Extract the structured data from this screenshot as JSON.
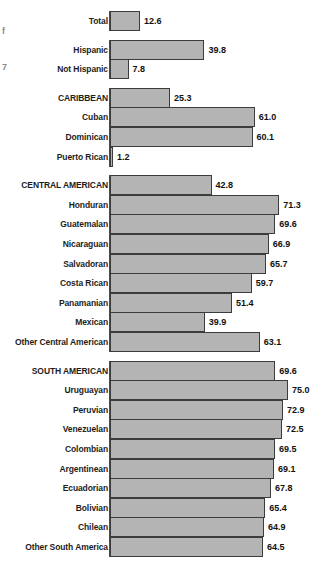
{
  "edge_artifacts": [
    {
      "text": "f",
      "top": 26
    },
    {
      "text": "7",
      "top": 62
    }
  ],
  "chart_data": {
    "type": "bar",
    "orientation": "horizontal",
    "title": "",
    "xlabel": "",
    "ylabel": "",
    "xlim": [
      0,
      75
    ],
    "grid": false,
    "legend": null,
    "axis_baseline": 0,
    "categories": [
      "Total",
      "Hispanic",
      "Not Hispanic",
      "CARIBBEAN",
      "Cuban",
      "Dominican",
      "Puerto Rican",
      "CENTRAL AMERICAN",
      "Honduran",
      "Guatemalan",
      "Nicaraguan",
      "Salvadoran",
      "Costa Rican",
      "Panamanian",
      "Mexican",
      "Other Central American",
      "SOUTH AMERICAN",
      "Uruguayan",
      "Peruvian",
      "Venezuelan",
      "Colombian",
      "Argentinean",
      "Ecuadorian",
      "Bolivian",
      "Chilean",
      "Other South America",
      "ALL OTHER HISPANIC"
    ],
    "values": [
      12.6,
      39.8,
      7.8,
      25.3,
      61.0,
      60.1,
      1.2,
      42.8,
      71.3,
      69.6,
      66.9,
      65.7,
      59.7,
      51.4,
      39.9,
      63.1,
      69.6,
      75.0,
      72.9,
      72.5,
      69.5,
      69.1,
      67.8,
      65.4,
      64.9,
      64.5,
      17.6
    ],
    "value_labels": [
      "12.6",
      "39.8",
      "7.8",
      "25.3",
      "61.0",
      "60.1",
      "1.2",
      "42.8",
      "71.3",
      "69.6",
      "66.9",
      "65.7",
      "59.7",
      "51.4",
      "39.9",
      "63.1",
      "69.6",
      "75.0",
      "72.9",
      "72.5",
      "69.5",
      "69.1",
      "67.8",
      "65.4",
      "64.9",
      "64.5",
      "17.6"
    ],
    "groups": [
      {
        "name": "overall",
        "start_index": 0,
        "count": 1
      },
      {
        "name": "hispanic-split",
        "start_index": 1,
        "count": 2
      },
      {
        "name": "caribbean",
        "start_index": 3,
        "count": 4
      },
      {
        "name": "central-american",
        "start_index": 7,
        "count": 9
      },
      {
        "name": "south-american",
        "start_index": 16,
        "count": 10
      },
      {
        "name": "all-other-hispanic",
        "start_index": 26,
        "count": 1
      }
    ],
    "colors": {
      "bar_fill": "#b4b4b4",
      "bar_border": "#3c3c3c",
      "axis": "#4a4a4a",
      "label_text": "#1d1d1d",
      "value_text": "#111111",
      "background": "#ffffff"
    }
  }
}
